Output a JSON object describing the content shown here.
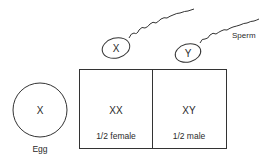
{
  "egg": {
    "chromosome": "X",
    "label": "Egg"
  },
  "sperm": {
    "label": "Sperm",
    "items": [
      {
        "chromosome": "X"
      },
      {
        "chromosome": "Y"
      }
    ]
  },
  "outcomes": [
    {
      "genotype": "XX",
      "description": "1/2 female"
    },
    {
      "genotype": "XY",
      "description": "1/2 male"
    }
  ],
  "colors": {
    "line": "#333333",
    "text": "#2a2a2a",
    "background": "#ffffff"
  }
}
